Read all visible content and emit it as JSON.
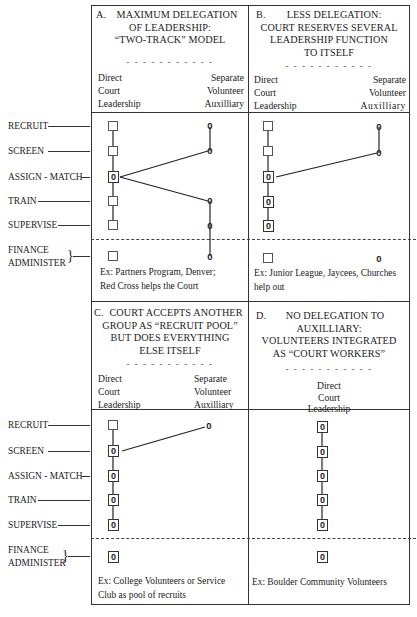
{
  "row_labels": {
    "recruit": "RECRUIT",
    "screen": "SCREEN",
    "assign_match": "ASSIGN - MATCH",
    "train": "TRAIN",
    "supervise": "SUPERVISE",
    "finance": "FINANCE",
    "administer": "ADMINISTER"
  },
  "separator": "- - - - - - - - - - -",
  "column_headers": {
    "direct": [
      "Direct",
      "Court",
      "Leadership"
    ],
    "separate": [
      "Separate",
      "Volunteer",
      "Auxilliary"
    ]
  },
  "panels": {
    "a": {
      "letter": "A.",
      "title_lines": [
        "MAXIMUM DELEGATION",
        "OF LEADERSHIP:",
        "“TWO-TRACK” MODEL"
      ],
      "example_lines": [
        "Ex: Partners Program, Denver;",
        "Red Cross helps the Court"
      ],
      "direct_markers": [
        "box",
        "box",
        "o-box",
        "box",
        "box",
        "box"
      ],
      "auxiliary_markers": [
        "o",
        "o",
        "",
        "o",
        "o",
        "o"
      ]
    },
    "b": {
      "letter": "B.",
      "title_lines": [
        "LESS DELEGATION:",
        "COURT RESERVES SEVERAL",
        "LEADERSHIP FUNCTION",
        "TO ITSELF"
      ],
      "example_lines": [
        "Ex: Junior League, Jaycees, Churches",
        "help out"
      ],
      "direct_markers": [
        "box",
        "box",
        "o-box",
        "o-box",
        "o-box",
        "box"
      ],
      "auxiliary_markers": [
        "o",
        "o",
        "",
        "",
        "",
        "o"
      ]
    },
    "c": {
      "letter": "C.",
      "title_lines": [
        "COURT ACCEPTS ANOTHER",
        "GROUP AS “RECRUIT POOL”",
        "BUT DOES EVERYTHING",
        "ELSE ITSELF"
      ],
      "example_lines": [
        "Ex: College Volunteers or Service",
        "Club as pool of recruits"
      ],
      "direct_markers": [
        "box",
        "o-box",
        "o-box",
        "o-box",
        "o-box",
        "o-box"
      ],
      "auxiliary_markers": [
        "o",
        "",
        "",
        "",
        "",
        ""
      ]
    },
    "d": {
      "letter": "D.",
      "title_lines": [
        "NO DELEGATION TO",
        "AUXILLIARY:",
        "VOLUNTEERS INTEGRATED",
        "AS “COURT WORKERS”"
      ],
      "example_lines": [
        "Ex: Boulder Community Volunteers"
      ],
      "direct_markers": [
        "o-box",
        "o-box",
        "o-box",
        "o-box",
        "o-box",
        "o-box"
      ]
    }
  },
  "glyphs": {
    "volunteer_marker": "0"
  }
}
